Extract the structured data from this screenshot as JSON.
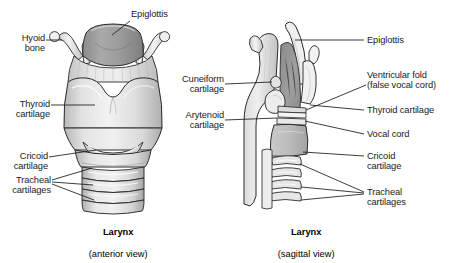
{
  "figure": {
    "type": "anatomical-illustration",
    "background": "#ffffff",
    "line_color": "#1a1a1a",
    "text_color": "#1a1a1a"
  },
  "palette": {
    "cartilage_light": "#e9e9e9",
    "cartilage_mid": "#cfcfcf",
    "cartilage_dark": "#a8a8a8",
    "epiglottis_fill": "#9d9d9d",
    "interior_dark": "#8f8f8f",
    "highlight": "#f6f6f6",
    "outline": "#2b2b2b"
  },
  "panels": [
    {
      "id": "anterior",
      "caption_title": "Larynx",
      "caption_sub": "(anterior view)",
      "labels": [
        {
          "id": "epiglottis",
          "text": "Epiglottis",
          "align": "left"
        },
        {
          "id": "hyoid-bone",
          "text": "Hyoid\nbone",
          "align": "left"
        },
        {
          "id": "thyroid-cartilage",
          "text": "Thyroid\ncartilage",
          "align": "left"
        },
        {
          "id": "cricoid-cartilage",
          "text": "Cricoid\ncartilage",
          "align": "left"
        },
        {
          "id": "tracheal-cartilages",
          "text": "Tracheal\ncartilages",
          "align": "left"
        }
      ]
    },
    {
      "id": "sagittal",
      "caption_title": "Larynx",
      "caption_sub": "(sagittal view)",
      "labels": [
        {
          "id": "epiglottis",
          "text": "Epiglottis",
          "align": "left"
        },
        {
          "id": "cuneiform-cartilage",
          "text": "Cuneiform\ncartilage",
          "align": "left"
        },
        {
          "id": "arytenoid-cartilage",
          "text": "Arytenoid\ncartilage",
          "align": "left"
        },
        {
          "id": "ventricular-fold",
          "text": "Ventricular fold\n(false vocal cord)",
          "align": "left"
        },
        {
          "id": "thyroid-cartilage",
          "text": "Thyroid cartilage",
          "align": "left"
        },
        {
          "id": "vocal-cord",
          "text": "Vocal cord",
          "align": "left"
        },
        {
          "id": "cricoid-cartilage",
          "text": "Cricoid\ncartilage",
          "align": "left"
        },
        {
          "id": "tracheal-cartilages",
          "text": "Tracheal\ncartilages",
          "align": "left"
        }
      ]
    }
  ],
  "text": {
    "epiglottis_a": "Epiglottis",
    "hyoid_bone": "Hyoid\nbone",
    "thyroid_cartilage_a": "Thyroid\ncartilage",
    "cricoid_cartilage_a": "Cricoid\ncartilage",
    "tracheal_cartilages_a": "Tracheal\ncartilages",
    "caption_a_title": "Larynx",
    "caption_a_sub": "(anterior view)",
    "cuneiform_cartilage": "Cuneiform\ncartilage",
    "arytenoid_cartilage": "Arytenoid\ncartilage",
    "epiglottis_s": "Epiglottis",
    "ventricular_fold": "Ventricular fold\n(false vocal cord)",
    "thyroid_cartilage_s": "Thyroid cartilage",
    "vocal_cord": "Vocal cord",
    "cricoid_cartilage_s": "Cricoid\ncartilage",
    "tracheal_cartilages_s": "Tracheal\ncartilages",
    "caption_s_title": "Larynx",
    "caption_s_sub": "(sagittal view)"
  }
}
